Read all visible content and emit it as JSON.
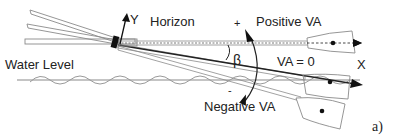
{
  "diagram": {
    "labels": {
      "y_axis": "Y",
      "x_axis": "X",
      "horizon": "Horizon",
      "plus": "+",
      "minus": "-",
      "positive_va": "Positive VA",
      "negative_va": "Negative VA",
      "va_zero": "VA = 0",
      "beta": "β",
      "water_level": "Water Level",
      "panel": "a)"
    },
    "colors": {
      "line": "#222222",
      "shaft_outline": "#8a8a8a",
      "water": "#9a9a9a",
      "dash": "#444444"
    }
  }
}
